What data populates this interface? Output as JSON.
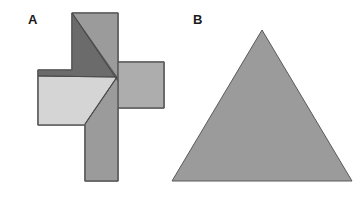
{
  "figure": {
    "width": 363,
    "height": 219,
    "background": "#ffffff"
  },
  "panels": [
    {
      "id": "A",
      "label": "A",
      "label_x": 28,
      "label_y": 24,
      "shape": "greek-cross-dissection",
      "description": "Greek cross dissected into four pieces"
    },
    {
      "id": "B",
      "label": "B",
      "label_x": 193,
      "label_y": 24,
      "shape": "equilateral-triangle",
      "description": "Equilateral triangle"
    }
  ],
  "colors": {
    "dark_gray": "#6b6b6b",
    "medium_gray": "#9b9b9b",
    "medium_light_gray": "#adadad",
    "light_gray": "#d5d5d5",
    "outline": "#5a5a5a",
    "label_text": "#1a1a1a",
    "background": "#ffffff"
  },
  "cross_pieces": [
    {
      "name": "piece-dark-upper",
      "fill": "#6b6b6b",
      "points": "72,13 72,53 38,53 38,70 117,77 72,13"
    },
    {
      "name": "piece-medium-upper-right",
      "fill": "#9b9b9b",
      "points": "72,13 118,13 118,62 117,77 72,13"
    },
    {
      "name": "piece-light-left",
      "fill": "#d5d5d5",
      "points": "38,70 117,77 85,109 85,125 38,125 38,70"
    },
    {
      "name": "piece-light-lower-center",
      "fill": "#d5d5d5",
      "points": "117,77 85,109 85,125 85,125 117,77"
    },
    {
      "name": "piece-medium-right-arm",
      "fill": "#adadad",
      "points": "118,62 164,62 164,108 118,108 118,62"
    },
    {
      "name": "piece-medium-lower-stem",
      "fill": "#9b9b9b",
      "points": "117,77 118,108 118,181 85,181 85,125 85,109 117,77"
    }
  ],
  "triangle_b": {
    "name": "equilateral-triangle",
    "fill": "#9b9b9b",
    "apex": [
      262,
      30
    ],
    "base_left": [
      172,
      181
    ],
    "base_right": [
      352,
      181
    ]
  }
}
